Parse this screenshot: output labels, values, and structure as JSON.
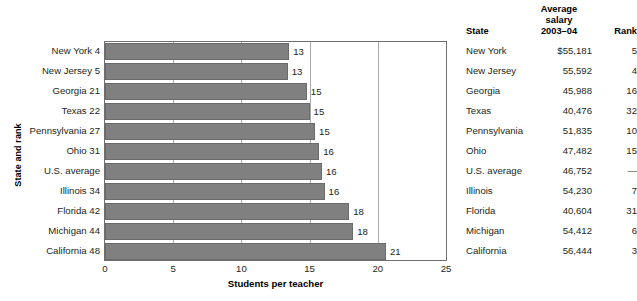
{
  "chart_data": {
    "type": "bar",
    "orientation": "horizontal",
    "title": "",
    "xlabel": "Students per teacher",
    "ylabel": "State and rank",
    "xlim": [
      0,
      25
    ],
    "xticks": [
      0,
      5,
      10,
      15,
      20,
      25
    ],
    "grid": true,
    "grid_axis": "x",
    "bar_color": "#808080",
    "categories": [
      "New York 4",
      "New Jersey 5",
      "Georgia 21",
      "Texas 22",
      "Pennsylvania 27",
      "Ohio 31",
      "U.S. average",
      "Illinois 34",
      "Florida 42",
      "Michigan 44",
      "California 48"
    ],
    "values": [
      13.5,
      13.4,
      14.8,
      15.0,
      15.4,
      15.7,
      15.9,
      16.1,
      17.9,
      18.2,
      20.6
    ],
    "value_labels": [
      "13",
      "13",
      "15",
      "15",
      "15",
      "16",
      "16",
      "16",
      "18",
      "18",
      "21"
    ]
  },
  "table": {
    "headers": {
      "state": "State",
      "salary_line1": "Average",
      "salary_line2": "salary",
      "salary_line3": "2003–04",
      "rank": "Rank"
    },
    "rows": [
      {
        "state": "New York",
        "salary": "$55,181",
        "rank": "5"
      },
      {
        "state": "New Jersey",
        "salary": "55,592",
        "rank": "4"
      },
      {
        "state": "Georgia",
        "salary": "45,988",
        "rank": "16"
      },
      {
        "state": "Texas",
        "salary": "40,476",
        "rank": "32"
      },
      {
        "state": "Pennsylvania",
        "salary": "51,835",
        "rank": "10"
      },
      {
        "state": "Ohio",
        "salary": "47,482",
        "rank": "15"
      },
      {
        "state": "U.S. average",
        "salary": "46,752",
        "rank": "—"
      },
      {
        "state": "Illinois",
        "salary": "54,230",
        "rank": "7"
      },
      {
        "state": "Florida",
        "salary": "40,604",
        "rank": "31"
      },
      {
        "state": "Michigan",
        "salary": "54,412",
        "rank": "6"
      },
      {
        "state": "California",
        "salary": "56,444",
        "rank": "3"
      }
    ]
  }
}
